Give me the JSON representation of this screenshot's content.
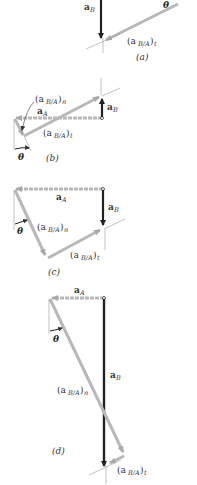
{
  "figure": {
    "colors": {
      "a_B": "#222222",
      "a_A": "#b8b8b8",
      "a_BA": "#b8b8b8",
      "guide": "#999999"
    },
    "panels": [
      {
        "id": "a",
        "caption": "(a)",
        "labels": {
          "aB": "a",
          "aB_sub": "B",
          "aBA_t": "(a",
          "aBA_t_sub": "B/A",
          "aBA_t_close": ")",
          "aBA_t_idx": "t",
          "theta": "θ"
        }
      },
      {
        "id": "b",
        "caption": "(b)",
        "labels": {
          "aBA_n": "(a",
          "aBA_n_sub": "B/A",
          "aBA_n_close": ")",
          "aBA_n_idx": "n",
          "aA": "a",
          "aA_sub": "A",
          "aB": "a",
          "aB_sub": "B",
          "aBA_t": "(a",
          "aBA_t_sub": "B/A",
          "aBA_t_close": ")",
          "aBA_t_idx": "t",
          "theta": "θ"
        }
      },
      {
        "id": "c",
        "caption": "(c)",
        "labels": {
          "aA": "a",
          "aA_sub": "A",
          "aB": "a",
          "aB_sub": "B",
          "aBA_n": "(a",
          "aBA_n_sub": "B/A",
          "aBA_n_close": ")",
          "aBA_n_idx": "n",
          "aBA_t": "(a",
          "aBA_t_sub": "B/A",
          "aBA_t_close": ")",
          "aBA_t_idx": "t",
          "theta": "θ"
        }
      },
      {
        "id": "d",
        "caption": "(d)",
        "labels": {
          "aA": "a",
          "aA_sub": "A",
          "aB": "a",
          "aB_sub": "B",
          "aBA_n": "(a",
          "aBA_n_sub": "B/A",
          "aBA_n_close": ")",
          "aBA_n_idx": "n",
          "aBA_t": "(a",
          "aBA_t_sub": "B/A",
          "aBA_t_close": ")",
          "aBA_t_idx": "t",
          "theta": "θ"
        }
      }
    ]
  }
}
